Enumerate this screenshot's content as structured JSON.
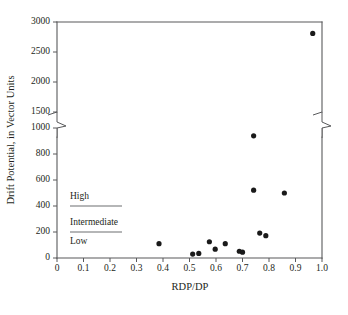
{
  "chart_data": {
    "type": "scatter",
    "title": "",
    "xlabel": "RDP/DP",
    "ylabel": "Drift Potential, in Vector Units",
    "xlim": [
      0,
      1.0
    ],
    "ylim": [
      0,
      3000
    ],
    "grid": false,
    "legend_position": "inside-left",
    "y_axis_break": {
      "present": true,
      "below": 1000,
      "above": 1500
    },
    "xticks": [
      0,
      0.1,
      0.2,
      0.3,
      0.4,
      0.5,
      0.6,
      0.7,
      0.8,
      0.9,
      1.0
    ],
    "xticklabels": [
      "0",
      "0.1",
      "0.2",
      "0.3",
      "0.4",
      "0.5",
      "0.6",
      "0.7",
      "0.8",
      "0.9",
      "1.0"
    ],
    "yticks": [
      0,
      200,
      400,
      600,
      800,
      1000,
      1500,
      2000,
      2500,
      3000
    ],
    "yticklabels": [
      "0",
      "200",
      "400",
      "600",
      "800",
      "1000",
      "1500",
      "2000",
      "2500",
      "3000"
    ],
    "points": [
      {
        "x": 0.385,
        "y": 110
      },
      {
        "x": 0.512,
        "y": 30
      },
      {
        "x": 0.535,
        "y": 35
      },
      {
        "x": 0.575,
        "y": 125
      },
      {
        "x": 0.597,
        "y": 68
      },
      {
        "x": 0.635,
        "y": 110
      },
      {
        "x": 0.688,
        "y": 52
      },
      {
        "x": 0.7,
        "y": 45
      },
      {
        "x": 0.742,
        "y": 940
      },
      {
        "x": 0.742,
        "y": 522
      },
      {
        "x": 0.765,
        "y": 192
      },
      {
        "x": 0.788,
        "y": 172
      },
      {
        "x": 0.858,
        "y": 500
      },
      {
        "x": 0.965,
        "y": 2810
      }
    ],
    "marker": "circle",
    "marker_color": "#1a1a1a",
    "legend_bands": [
      {
        "label": "High",
        "rule_value": 400
      },
      {
        "label": "Intermediate",
        "rule_value": 200
      },
      {
        "label": "Low",
        "rule_value": null
      }
    ]
  },
  "colors": {
    "axis": "#58595b",
    "text": "#231f20",
    "marker": "#1a1a1a",
    "legend_rule": "#6d6e71",
    "background": "#ffffff"
  }
}
